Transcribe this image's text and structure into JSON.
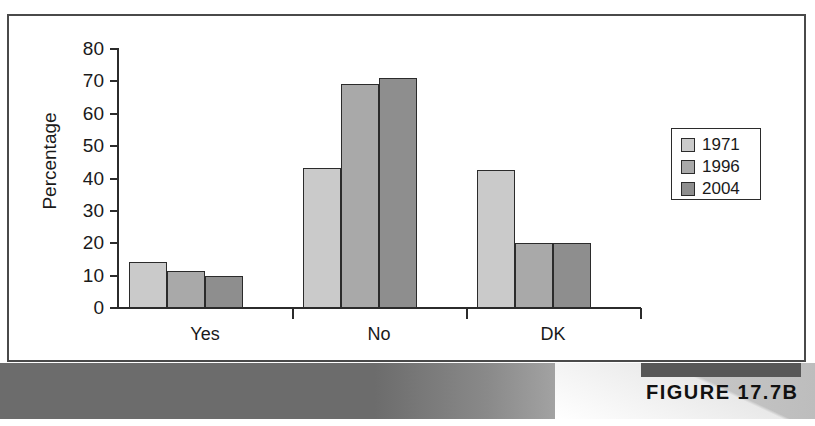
{
  "figure": {
    "caption": "Legitimacy of the Democratic System",
    "number_label": "FIGURE 17.7B"
  },
  "chart_data": {
    "type": "bar",
    "title": "Legitimacy of the Democratic System",
    "xlabel": "",
    "ylabel": "Percentage",
    "categories": [
      "Yes",
      "No",
      "DK"
    ],
    "series": [
      {
        "name": "1971",
        "color": "#cacaca",
        "values": [
          14.3,
          43.3,
          42.5
        ]
      },
      {
        "name": "1996",
        "color": "#a9a9a9",
        "values": [
          11.3,
          69.3,
          20.0
        ]
      },
      {
        "name": "2004",
        "color": "#8e8e8e",
        "values": [
          9.8,
          71.0,
          20.0
        ]
      }
    ],
    "ylim": [
      0,
      80
    ],
    "yticks": [
      0,
      10,
      20,
      30,
      40,
      50,
      60,
      70,
      80
    ],
    "ytick_labels": [
      "0",
      "10",
      "20",
      "30",
      "40",
      "50",
      "60",
      "70",
      "80"
    ],
    "grid": false,
    "legend_position": "right"
  },
  "legend": {
    "entries": [
      {
        "label": "1971",
        "color": "#cacaca"
      },
      {
        "label": "1996",
        "color": "#a9a9a9"
      },
      {
        "label": "2004",
        "color": "#8e8e8e"
      }
    ]
  },
  "colors": {
    "series_1971": "#cacaca",
    "series_1996": "#a9a9a9",
    "series_2004": "#8e8e8e",
    "caption_bar": "#6c6c6c",
    "axis": "#2b2b2b",
    "frame": "#4a4a4a"
  }
}
